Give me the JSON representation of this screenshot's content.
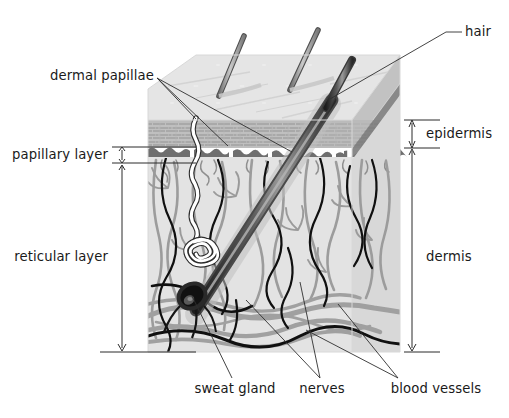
{
  "figure": {
    "kind": "anatomical-diagram",
    "colors": {
      "ink": "#1a1a1a",
      "leader_line": "#3a3a3a",
      "top_face": "#e3e3e3",
      "side_face": "#cfcfcf",
      "epidermis_band": "#a8a8a8",
      "junction_line": "#6e6e6e",
      "dermis_fill": "#e2e2e2",
      "vessel_gray": "#999999",
      "nerve_black": "#111111",
      "hair_dark": "#2b2b2b",
      "sweat_gland_white": "#ffffff"
    }
  },
  "labels": {
    "hair": "hair",
    "dermal_papillae": "dermal papillae",
    "papillary_layer": "papillary layer",
    "reticular_layer": "reticular layer",
    "epidermis": "epidermis",
    "dermis": "dermis",
    "sweat_gland": "sweat gland",
    "nerves": "nerves",
    "blood_vessels": "blood vessels"
  },
  "structures": {
    "hair_shafts_on_surface": 3,
    "hair_follicle_with_bulb": 1,
    "sweat_glands": 1,
    "layer_bands": [
      "epidermis",
      "papillary layer",
      "reticular layer"
    ],
    "bracket_measures": [
      {
        "name": "papillary layer",
        "side": "left",
        "span_px": [
          147,
          163
        ]
      },
      {
        "name": "reticular layer",
        "side": "left",
        "span_px": [
          163,
          352
        ]
      },
      {
        "name": "epidermis",
        "side": "right",
        "span_px": [
          120,
          148
        ]
      },
      {
        "name": "dermis",
        "side": "right",
        "span_px": [
          148,
          352
        ]
      }
    ]
  }
}
